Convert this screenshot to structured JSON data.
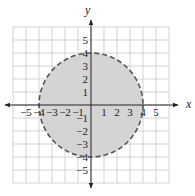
{
  "chart_data": {
    "type": "region",
    "title": "",
    "xlabel": "x",
    "ylabel": "y",
    "xlim": [
      -6,
      6
    ],
    "ylim": [
      -6,
      6
    ],
    "grid": true,
    "x_tick_labels": [
      "-5",
      "-4",
      "-3",
      "-2",
      "-1",
      "1",
      "2",
      "3",
      "4",
      "5"
    ],
    "y_tick_labels": [
      "5",
      "4",
      "3",
      "2",
      "1",
      "-1",
      "-2",
      "-3",
      "-4",
      "-5"
    ],
    "shapes": [
      {
        "shape": "circle",
        "center": [
          0,
          0
        ],
        "radius": 4,
        "boundary": "dashed",
        "fill": "shaded"
      }
    ]
  },
  "colors": {
    "grid": "#c8c8c8",
    "axis": "#222222",
    "fill": "#d4d4d4",
    "boundary": "#555555"
  },
  "axes": {
    "x_label": "x",
    "y_label": "y"
  }
}
